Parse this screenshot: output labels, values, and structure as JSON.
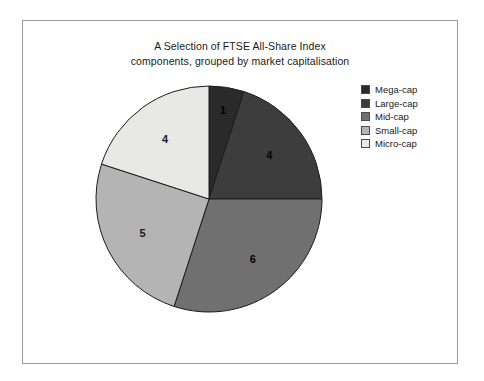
{
  "figure": {
    "border_color": "#9a9a9a",
    "background": "#ffffff"
  },
  "chart_data": {
    "type": "pie",
    "title": "A Selection of FTSE All-Share Index components, grouped by market capitalisation",
    "title_lines": [
      "A Selection of FTSE All-Share Index",
      "components, grouped by market capitalisation"
    ],
    "categories": [
      "Mega-cap",
      "Large-cap",
      "Mid-cap",
      "Small-cap",
      "Micro-cap"
    ],
    "values": [
      1,
      4,
      6,
      5,
      4
    ],
    "labels": [
      "1",
      "4",
      "6",
      "5",
      "4"
    ],
    "total": 20,
    "colors": [
      "#2a2a2a",
      "#3d3d3d",
      "#707070",
      "#b4b4b4",
      "#e8e8e6"
    ],
    "label_colors": [
      "#000000",
      "#000000",
      "#000000",
      "#1a1a1a",
      "#1a1a1a"
    ],
    "start_angle_deg": 0,
    "direction": "clockwise",
    "slice_border_color": "#1c1c1c",
    "legend_position": "right",
    "grid": false,
    "xlabel": "",
    "ylabel": "",
    "slices": [
      {
        "name": "Mega-cap",
        "value": 1,
        "label": "1",
        "color": "#2a2a2a",
        "percent": 5
      },
      {
        "name": "Large-cap",
        "value": 4,
        "label": "4",
        "color": "#3d3d3d",
        "percent": 20
      },
      {
        "name": "Mid-cap",
        "value": 6,
        "label": "6",
        "color": "#707070",
        "percent": 30
      },
      {
        "name": "Small-cap",
        "value": 5,
        "label": "5",
        "color": "#b4b4b4",
        "percent": 25
      },
      {
        "name": "Micro-cap",
        "value": 4,
        "label": "4",
        "color": "#e8e8e6",
        "percent": 20
      }
    ]
  },
  "legend": {
    "items": [
      {
        "label": "Mega-cap",
        "color": "#2a2a2a"
      },
      {
        "label": "Large-cap",
        "color": "#3d3d3d"
      },
      {
        "label": "Mid-cap",
        "color": "#707070"
      },
      {
        "label": "Small-cap",
        "color": "#b4b4b4"
      },
      {
        "label": "Micro-cap",
        "color": "#e8e8e6"
      }
    ]
  }
}
